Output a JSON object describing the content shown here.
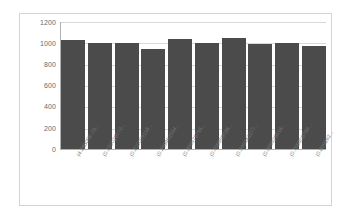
{
  "chart_data": {
    "type": "bar",
    "title": "",
    "subtitle": "",
    "xlabel": "",
    "ylabel": "",
    "ylim": [
      0,
      1200
    ],
    "grid": true,
    "legend": false,
    "legend_position": "none",
    "bar_color": "#4b4b4b",
    "categories": [
      "(4.28509E-05...",
      "(0.100026072...",
      "(0.200009118...",
      "(0.299992554...",
      "(0.399975795...",
      "(0.499959036...",
      "(0.599942277...",
      "(0.699925518...",
      "(0.799908759...",
      "(0.899892..."
    ],
    "values": [
      1020,
      995,
      995,
      935,
      1030,
      995,
      1040,
      980,
      995,
      970
    ],
    "yticks": [
      0,
      200,
      400,
      600,
      800,
      1000,
      1200
    ],
    "ytick_labels": [
      "0",
      "200",
      "400",
      "600",
      "800",
      "1000",
      "1200"
    ]
  },
  "axes": {
    "y": {
      "labels": [
        "1200",
        "1000",
        "800",
        "600",
        "400",
        "200",
        "0"
      ]
    }
  }
}
